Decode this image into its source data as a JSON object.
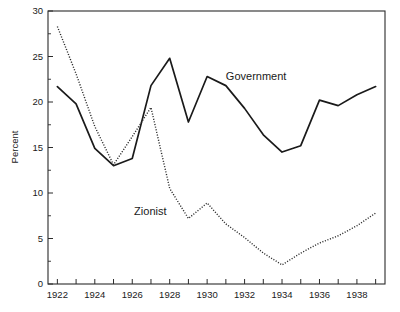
{
  "chart_data": {
    "type": "line",
    "title": "",
    "subtitle": "",
    "xlabel": "",
    "ylabel": "Percent",
    "xlim": [
      1921.5,
      1939.5
    ],
    "ylim": [
      0,
      30
    ],
    "grid": false,
    "legend_position": "inline-annotations",
    "x": [
      1922,
      1923,
      1924,
      1925,
      1926,
      1927,
      1928,
      1929,
      1930,
      1931,
      1932,
      1933,
      1934,
      1935,
      1936,
      1937,
      1938,
      1939
    ],
    "y_ticks": [
      0,
      5,
      10,
      15,
      20,
      25,
      30
    ],
    "y_tick_labels": [
      "0",
      "5",
      "10",
      "15",
      "20",
      "25",
      "30"
    ],
    "y_minor_ticks": [
      2.5,
      7.5,
      12.5,
      17.5,
      22.5,
      27.5
    ],
    "x_ticks": [
      1922,
      1923,
      1924,
      1925,
      1926,
      1927,
      1928,
      1929,
      1930,
      1931,
      1932,
      1933,
      1934,
      1935,
      1936,
      1937,
      1938,
      1939
    ],
    "x_tick_labels": [
      {
        "value": 1922,
        "label": "1922"
      },
      {
        "value": 1924,
        "label": "1924"
      },
      {
        "value": 1926,
        "label": "1926"
      },
      {
        "value": 1928,
        "label": "1928"
      },
      {
        "value": 1930,
        "label": "1930"
      },
      {
        "value": 1932,
        "label": "1932"
      },
      {
        "value": 1934,
        "label": "1934"
      },
      {
        "value": 1936,
        "label": "1936"
      },
      {
        "value": 1938,
        "label": "1938"
      }
    ],
    "series": [
      {
        "name": "Government",
        "style": "solid",
        "color": "#1a1a1a",
        "label_text": "Government",
        "label_x": 1931.0,
        "label_y": 22.4,
        "x": [
          1922,
          1923,
          1924,
          1925,
          1926,
          1927,
          1928,
          1929,
          1930,
          1931,
          1932,
          1933,
          1934,
          1935,
          1936,
          1937,
          1938,
          1939
        ],
        "values": [
          21.7,
          19.8,
          14.9,
          13.0,
          13.8,
          21.8,
          24.8,
          17.8,
          22.8,
          21.8,
          19.3,
          16.4,
          14.5,
          15.2,
          20.2,
          19.6,
          20.8,
          21.7
        ]
      },
      {
        "name": "Zionist",
        "style": "dotted",
        "color": "#2b2b2b",
        "label_text": "Zionist",
        "label_x": 1926.1,
        "label_y": 7.6,
        "x": [
          1922,
          1923,
          1924,
          1925,
          1926,
          1927,
          1928,
          1929,
          1930,
          1931,
          1932,
          1933,
          1934,
          1935,
          1936,
          1937,
          1938,
          1939
        ],
        "values": [
          28.3,
          23.1,
          17.3,
          13.1,
          16.2,
          19.4,
          10.5,
          7.2,
          8.9,
          6.6,
          5.1,
          3.4,
          2.1,
          3.4,
          4.5,
          5.3,
          6.4,
          7.8
        ]
      }
    ]
  }
}
